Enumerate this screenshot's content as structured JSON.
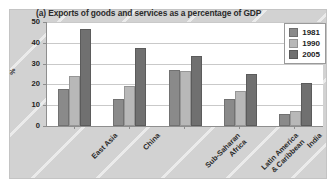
{
  "chart_data": {
    "type": "bar",
    "title": "(a) Exports of goods and services as a percentage of GDP",
    "xlabel": "",
    "ylabel": "%",
    "ylim": [
      0,
      50
    ],
    "yticks": [
      0,
      10,
      20,
      30,
      40,
      50
    ],
    "grid": true,
    "legend_position": "top-right",
    "categories": [
      "East Asia",
      "China",
      "Sub-Saharan\nAfrica",
      "Latin America\n& Caribbean",
      "India"
    ],
    "category_lines": [
      [
        "East Asia"
      ],
      [
        "China"
      ],
      [
        "Sub-Saharan",
        "Africa"
      ],
      [
        "Latin America",
        "& Caribbean"
      ],
      [
        "India"
      ]
    ],
    "series": [
      {
        "name": "1981",
        "color": "#8a8a8a",
        "values": [
          18,
          13,
          27,
          13,
          6
        ]
      },
      {
        "name": "1990",
        "color": "#b8b8b8",
        "values": [
          24,
          19,
          26.5,
          17,
          7
        ]
      },
      {
        "name": "2005",
        "color": "#707070",
        "values": [
          46.5,
          37.5,
          33.5,
          25,
          20.5
        ]
      }
    ]
  },
  "legend": {
    "items": [
      {
        "label": "1981",
        "color": "#8a8a8a"
      },
      {
        "label": "1990",
        "color": "#b8b8b8"
      },
      {
        "label": "2005",
        "color": "#707070"
      }
    ]
  },
  "axis": {
    "y_tick_labels": [
      "50",
      "40",
      "30",
      "20",
      "10",
      "0"
    ],
    "y_axis_title": "%"
  },
  "colors": {
    "plate_background": "#d2d2d2",
    "plot_background": "#ffffff",
    "axis_line": "#8e8e8e",
    "gridline": "#c9c9c9",
    "text": "#2b2b2b"
  }
}
